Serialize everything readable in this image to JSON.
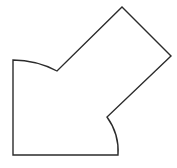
{
  "canvas": {
    "width": 177,
    "height": 168,
    "background_color": "#ffffff",
    "description": "line-drawing of an irregular closed polygon with two concave circular-arc edges"
  },
  "figure": {
    "name": "irregular-polygon-with-arcs",
    "stroke_color": "#2b2b2b",
    "fill_color": "#ffffff",
    "stroke_width": 1.4,
    "vertices": [
      {
        "id": "top-left-corner",
        "x": 13,
        "y": 60
      },
      {
        "id": "arc-end-upper",
        "x": 57,
        "y": 71
      },
      {
        "id": "apex-top",
        "x": 122,
        "y": 7
      },
      {
        "id": "right-corner",
        "x": 171,
        "y": 56
      },
      {
        "id": "inner-notch",
        "x": 107,
        "y": 117
      },
      {
        "id": "arc-end-lower",
        "x": 118,
        "y": 155
      },
      {
        "id": "bottom-left-corner",
        "x": 13,
        "y": 155
      }
    ],
    "edges": [
      {
        "id": "edge-top-arc",
        "type": "arc",
        "from": "top-left-corner",
        "to": "arc-end-upper",
        "radius": 96,
        "sweep": 1,
        "large_arc": 0
      },
      {
        "id": "edge-upper-left-diagonal",
        "type": "line",
        "from": "arc-end-upper",
        "to": "apex-top"
      },
      {
        "id": "edge-upper-right-diagonal",
        "type": "line",
        "from": "apex-top",
        "to": "right-corner"
      },
      {
        "id": "edge-lower-right-diagonal",
        "type": "line",
        "from": "right-corner",
        "to": "inner-notch"
      },
      {
        "id": "edge-bottom-arc",
        "type": "arc",
        "from": "inner-notch",
        "to": "arc-end-lower",
        "radius": 58,
        "sweep": 1,
        "large_arc": 0
      },
      {
        "id": "edge-bottom",
        "type": "line",
        "from": "arc-end-lower",
        "to": "bottom-left-corner"
      },
      {
        "id": "edge-left",
        "type": "line",
        "from": "bottom-left-corner",
        "to": "top-left-corner"
      }
    ],
    "path_d": "M 13,60 A 96,96 0 0 1 57,71 L 122,7 L 171,56 L 107,117 A 58,58 0 0 1 118,155 L 13,155 Z"
  }
}
